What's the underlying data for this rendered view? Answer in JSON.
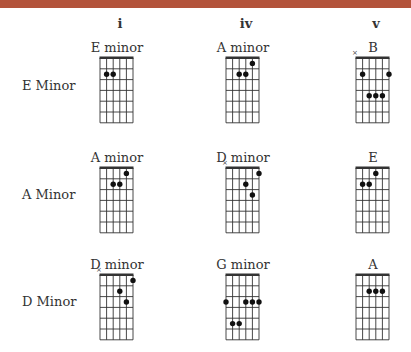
{
  "header": {
    "bar_color": "#b3533b"
  },
  "columns": [
    {
      "label": "i",
      "x": 120
    },
    {
      "label": "iv",
      "x": 246
    },
    {
      "label": "v",
      "x": 376
    }
  ],
  "rows": [
    {
      "label": "E Minor",
      "chords": [
        {
          "name": "E minor",
          "muted": [],
          "dots": [
            [
              2,
              2
            ],
            [
              3,
              2
            ]
          ]
        },
        {
          "name": "A minor",
          "muted": [],
          "dots": [
            [
              5,
              1
            ],
            [
              3,
              2
            ],
            [
              4,
              2
            ]
          ]
        },
        {
          "name": "B",
          "muted": [
            1
          ],
          "dots": [
            [
              2,
              2
            ],
            [
              6,
              2
            ],
            [
              3,
              4
            ],
            [
              4,
              4
            ],
            [
              5,
              4
            ]
          ]
        }
      ]
    },
    {
      "label": "A Minor",
      "chords": [
        {
          "name": "A minor",
          "muted": [],
          "dots": [
            [
              5,
              1
            ],
            [
              3,
              2
            ],
            [
              4,
              2
            ]
          ]
        },
        {
          "name": "D minor",
          "muted": [
            1
          ],
          "dots": [
            [
              6,
              1
            ],
            [
              4,
              2
            ],
            [
              5,
              3
            ]
          ]
        },
        {
          "name": "E",
          "muted": [],
          "dots": [
            [
              4,
              1
            ],
            [
              2,
              2
            ],
            [
              3,
              2
            ]
          ]
        }
      ]
    },
    {
      "label": "D Minor",
      "chords": [
        {
          "name": "D minor",
          "muted": [
            1
          ],
          "dots": [
            [
              6,
              1
            ],
            [
              4,
              2
            ],
            [
              5,
              3
            ]
          ]
        },
        {
          "name": "G minor",
          "muted": [],
          "dots": [
            [
              1,
              3
            ],
            [
              4,
              3
            ],
            [
              5,
              3
            ],
            [
              6,
              3
            ],
            [
              2,
              5
            ],
            [
              3,
              5
            ]
          ]
        },
        {
          "name": "A",
          "muted": [],
          "dots": [
            [
              3,
              2
            ],
            [
              4,
              2
            ],
            [
              5,
              2
            ]
          ]
        }
      ]
    }
  ],
  "grid": {
    "strings": 6,
    "frets": 6,
    "string_spacing": 6.6,
    "fret_spacing": 10.8,
    "line_color": "#333333",
    "dot_color": "#111111",
    "mute_symbol": "×"
  }
}
